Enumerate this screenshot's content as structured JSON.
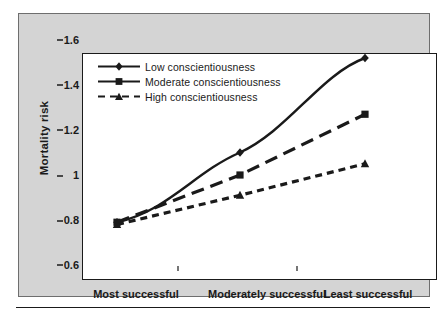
{
  "figure": {
    "panel_bg": "#d4d4d4",
    "plot_bg": "#ffffff",
    "ink": "#1a1a1a"
  },
  "axes": {
    "ylabel": "Mortality risk",
    "yticks": [
      "1.6",
      "1.4",
      "1.2",
      "1",
      "0.8",
      "0.6"
    ],
    "xticks": [
      "Most successful",
      "Moderately successful",
      "Least successful"
    ]
  },
  "legend": {
    "items": [
      {
        "label": "Low conscientiousness",
        "marker": "diamond-marker",
        "style": "solid"
      },
      {
        "label": "Moderate conscientiousness",
        "marker": "square-marker",
        "style": "long-dash"
      },
      {
        "label": "High conscientiousness",
        "marker": "triangle-marker",
        "style": "short-dash"
      }
    ]
  },
  "chart_data": {
    "type": "line",
    "title": "",
    "xlabel": "",
    "ylabel": "Mortality risk",
    "categories": [
      "Most successful",
      "Moderately successful",
      "Least successful"
    ],
    "ylim": [
      0.6,
      1.6
    ],
    "ytick_values": [
      1.6,
      1.4,
      1.2,
      1.0,
      0.8,
      0.6
    ],
    "grid": false,
    "legend_position": "top-left inside",
    "series": [
      {
        "name": "Low conscientiousness",
        "values": [
          0.79,
          1.1,
          1.52
        ],
        "line": "solid",
        "marker": "diamond",
        "color": "#1a1a1a"
      },
      {
        "name": "Moderate conscientiousness",
        "values": [
          0.79,
          1.0,
          1.27
        ],
        "line": "long-dash",
        "marker": "square",
        "color": "#1a1a1a"
      },
      {
        "name": "High conscientiousness",
        "values": [
          0.78,
          0.91,
          1.05
        ],
        "line": "short-dash",
        "marker": "triangle",
        "color": "#1a1a1a"
      }
    ]
  }
}
